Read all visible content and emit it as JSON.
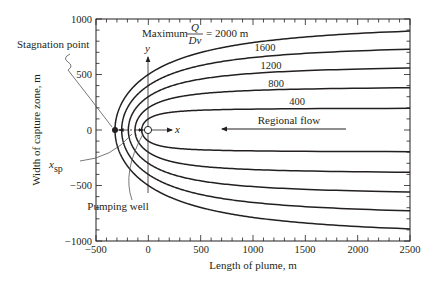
{
  "chart_data": {
    "type": "line",
    "title": "",
    "xlabel": "Length of plume, m",
    "ylabel": "Width of capture zone, m",
    "xlim": [
      -500,
      2500
    ],
    "ylim": [
      -1000,
      1000
    ],
    "x_ticks": [
      -500,
      0,
      500,
      1000,
      1500,
      2000,
      2500
    ],
    "x_tick_labels": [
      "−500",
      "0",
      "500",
      "1000",
      "1500",
      "2000",
      "2500"
    ],
    "y_ticks": [
      1000,
      500,
      0,
      -500,
      -1000
    ],
    "y_tick_labels": [
      "1000",
      "500",
      "0",
      "−500",
      "−1000"
    ],
    "minor_tick_step": 100,
    "grid": false,
    "legend": "inline labels on curves",
    "equation": "x = -y / tan(2π y / (Q/Dv))",
    "series": [
      {
        "name": "Q/Dv = 2000 m",
        "label": "= 2000 m",
        "q_over_dv": 2000,
        "stagnation_x": -318,
        "half_width_at_well": 500,
        "asymptote_half_width": 1000,
        "half_width_at_2500": 890
      },
      {
        "name": "Q/Dv = 1600 m",
        "label": "1600",
        "q_over_dv": 1600,
        "stagnation_x": -255,
        "half_width_at_well": 400,
        "asymptote_half_width": 800,
        "half_width_at_2500": 745
      },
      {
        "name": "Q/Dv = 1200 m",
        "label": "1200",
        "q_over_dv": 1200,
        "stagnation_x": -191,
        "half_width_at_well": 300,
        "asymptote_half_width": 600,
        "half_width_at_2500": 575
      },
      {
        "name": "Q/Dv = 800 m",
        "label": "800",
        "q_over_dv": 800,
        "stagnation_x": -127,
        "half_width_at_well": 200,
        "asymptote_half_width": 400,
        "half_width_at_2500": 392
      },
      {
        "name": "Q/Dv = 400 m",
        "label": "400",
        "q_over_dv": 400,
        "stagnation_x": -64,
        "half_width_at_well": 100,
        "asymptote_half_width": 200,
        "half_width_at_2500": 199
      }
    ],
    "annotations": {
      "maximum_prefix": "Maximum",
      "fraction_numerator": "Q",
      "fraction_denominator": "Dv",
      "stagnation_point": "Stagnation point",
      "x_sp": "x",
      "x_sp_sub": "sp",
      "pumping_well": "Pumping well",
      "regional_flow": "Regional flow",
      "x_axis_local": "x",
      "y_axis_local": "y"
    }
  }
}
